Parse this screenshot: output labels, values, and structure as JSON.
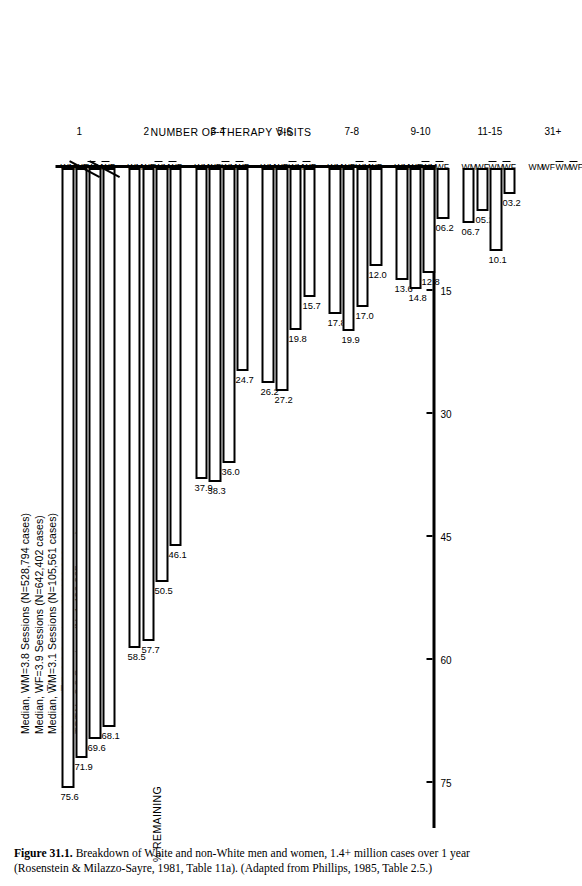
{
  "figure": {
    "number": "Figure 31.1.",
    "caption_text": "Breakdown of White and non-White men and women, 1.4+ million cases over 1 year (Rosenstein & Milazzo-Sayre, 1981, Table 11a). (Adapted from Phillips, 1985, Table 2.5.)"
  },
  "legend": {
    "lines": [
      "Median, WM=3.8 Sessions (N=528,794 cases)",
      "Median, WF=3.9 Sessions (N=642,402 cases)",
      "Median, W̅M=3.1 Sessions (N=105,561 cases)",
      "Median, W̅F=2.8 Sessions (N=129,308 cases)",
      "TOTAL=3.8 Sessions (N=1,406,065 cases)"
    ]
  },
  "chart_data": {
    "type": "bar",
    "title": "",
    "xlabel": "NUMBER OF THERAPY VISITS",
    "ylabel": "% REMAINING",
    "ylim": [
      0,
      78
    ],
    "yticks": [
      75,
      60,
      45,
      30,
      15
    ],
    "grid": false,
    "legend_position": "top-left",
    "categories": [
      "1",
      "2",
      "3-4",
      "5-6",
      "7-8",
      "9-10",
      "11-15",
      "31+"
    ],
    "series_labels": [
      "WM",
      "WF",
      "W̅M",
      "W̅F"
    ],
    "series": [
      {
        "name": "WM",
        "values": [
          75.6,
          58.5,
          37.9,
          26.2,
          17.8,
          13.6,
          6.7,
          null
        ]
      },
      {
        "name": "WF",
        "values": [
          71.9,
          57.7,
          38.3,
          27.2,
          19.9,
          14.8,
          5.2,
          null
        ]
      },
      {
        "name": "W̅M",
        "values": [
          69.6,
          50.5,
          36.0,
          19.8,
          17.0,
          12.8,
          10.1,
          null
        ]
      },
      {
        "name": "W̅F",
        "values": [
          68.1,
          46.1,
          24.7,
          15.7,
          12.0,
          6.2,
          3.2,
          null
        ]
      }
    ],
    "data_labels": {
      "1": [
        "75.6",
        "71.9",
        "69.6",
        "68.1"
      ],
      "2": [
        "58.5",
        "57.7",
        "50.5",
        "46.1"
      ],
      "3-4": [
        "37.9",
        "38.3",
        "36.0",
        "24.7"
      ],
      "5-6": [
        "26.2",
        "27.2",
        "19.8",
        "15.7"
      ],
      "7-8": [
        "17.8",
        "19.9",
        "17.0",
        "12.0"
      ],
      "9-10": [
        "13.6",
        "14.8",
        "12.8",
        "06.2"
      ],
      "11-15": [
        "06.7",
        "05.2",
        "10.1",
        "03.2"
      ],
      "31+": [
        "",
        "",
        "",
        ""
      ]
    },
    "axis_break": {
      "present": true,
      "before_category": "31+"
    }
  }
}
